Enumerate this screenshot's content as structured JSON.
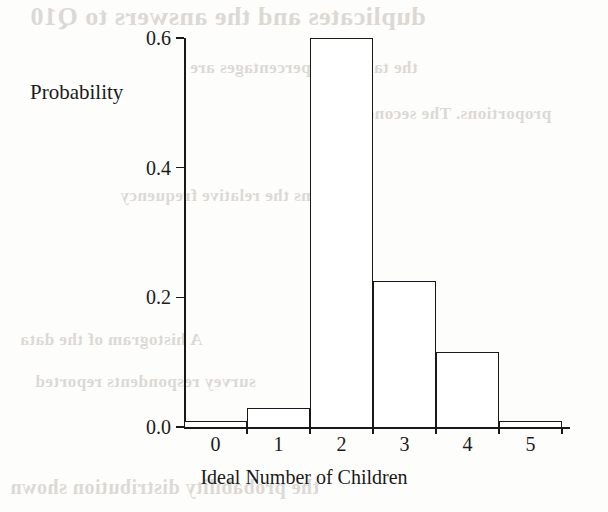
{
  "figure": {
    "ylabel": "Probability",
    "xlabel": "Ideal Number of Children"
  },
  "bleed_text": [
    "duplicates and the answers to Q10",
    "the tabulated percentages are",
    "proportions. The second row",
    "contains the relative frequency",
    "A histogram of the data",
    "survey respondents reported",
    "the probability distribution shown"
  ],
  "chart_data": {
    "type": "bar",
    "title": "",
    "xlabel": "Ideal Number of Children",
    "ylabel": "Probability",
    "categories": [
      "0",
      "1",
      "2",
      "3",
      "4",
      "5"
    ],
    "values": [
      0.01,
      0.03,
      0.6,
      0.225,
      0.115,
      0.01
    ],
    "xtick_labels": [
      "0",
      "1",
      "2",
      "3",
      "4",
      "5"
    ],
    "ytick_labels": [
      "0.0",
      "0.2",
      "0.4",
      "0.6"
    ],
    "ytick_values": [
      0.0,
      0.2,
      0.4,
      0.6
    ],
    "ylim": [
      0.0,
      0.6
    ],
    "grid": false,
    "legend": false,
    "bar_fill": "#ffffff",
    "bar_edge": "#181818"
  }
}
